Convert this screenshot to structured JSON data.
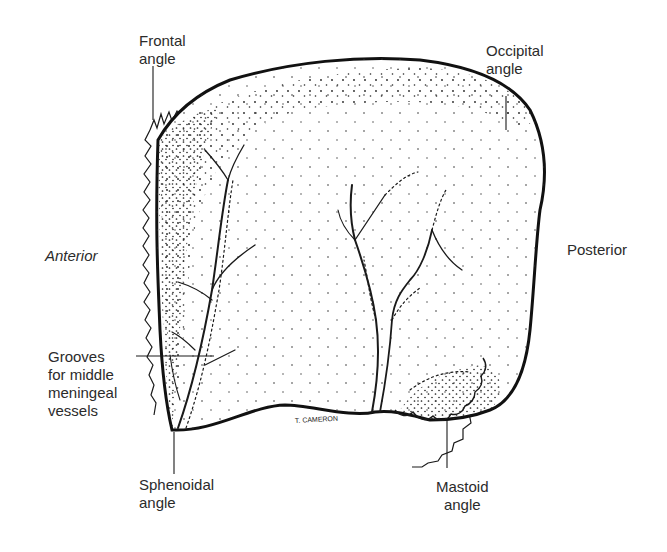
{
  "figure": {
    "labels": {
      "frontal_angle": "Frontal\nangle",
      "occipital_angle": "Occipital\nangle",
      "anterior": "Anterior",
      "posterior": "Posterior",
      "grooves": "Grooves\nfor middle\nmeningeal\nvessels",
      "sphenoidal_angle": "Sphenoidal\nangle",
      "mastoid_angle": "Mastoid\nangle"
    },
    "signature": "T. CAMERON",
    "colors": {
      "ink": "#1a1a1a",
      "background": "#ffffff",
      "label_text": "#2b2b2b"
    }
  }
}
